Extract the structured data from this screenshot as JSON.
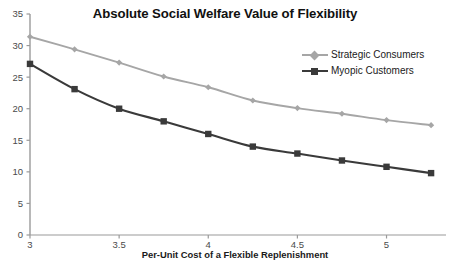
{
  "chart_data": {
    "type": "line",
    "title": "Absolute Social Welfare Value of Flexibility",
    "xlabel": "Per-Unit Cost of a Flexible Replenishment",
    "ylabel": "",
    "x": [
      3,
      3.25,
      3.5,
      3.75,
      4,
      4.25,
      4.5,
      4.75,
      5,
      5.25
    ],
    "xlim": [
      3,
      5.3
    ],
    "ylim": [
      0,
      35
    ],
    "xticks": [
      "3",
      "3.5",
      "4",
      "4.5",
      "5"
    ],
    "xtick_values": [
      3,
      3.5,
      4,
      4.5,
      5
    ],
    "yticks": [
      "0",
      "5",
      "10",
      "15",
      "20",
      "25",
      "30",
      "35"
    ],
    "ytick_values": [
      0,
      5,
      10,
      15,
      20,
      25,
      30,
      35
    ],
    "grid": false,
    "legend_position": "upper right",
    "series": [
      {
        "name": "Strategic Consumers",
        "color": "#a6a6a6",
        "marker": "diamond",
        "values": [
          31.4,
          29.4,
          27.3,
          25.1,
          23.4,
          21.3,
          20.1,
          19.2,
          18.2,
          17.4
        ]
      },
      {
        "name": "Myopic Customers",
        "color": "#3a3a3a",
        "marker": "square",
        "values": [
          27.1,
          23.1,
          20.0,
          18.0,
          16.0,
          14.0,
          12.9,
          11.8,
          10.8,
          9.8
        ]
      }
    ],
    "axis_color": "#9a9a9a",
    "background": "#ffffff"
  }
}
